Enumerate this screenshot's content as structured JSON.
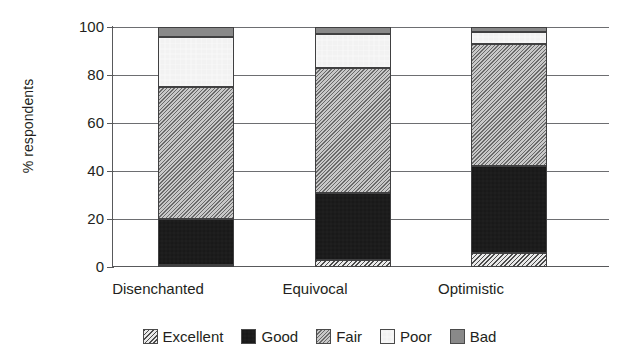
{
  "chart_data": {
    "type": "bar",
    "subtype": "stacked-bar-100",
    "title": "",
    "xlabel": "",
    "ylabel": "% respondents",
    "ylim": [
      0,
      100
    ],
    "yticks": [
      0,
      20,
      40,
      60,
      80,
      100
    ],
    "ytick_labels": [
      "0",
      "20",
      "40",
      "60",
      "80",
      "100"
    ],
    "grid": "horizontal",
    "legend_position": "bottom",
    "categories": [
      "Disenchanted",
      "Equivocal",
      "Optimistic"
    ],
    "series": [
      {
        "name": "Excellent",
        "values": [
          1,
          3,
          6
        ],
        "pattern": "diagonal-hatch",
        "color": "#b9b9b9"
      },
      {
        "name": "Good",
        "values": [
          19,
          28,
          36
        ],
        "pattern": "checkerboard-dark",
        "color": "#333333"
      },
      {
        "name": "Fair",
        "values": [
          55,
          52,
          51
        ],
        "pattern": "fine-diagonal",
        "color": "#9c9c9c"
      },
      {
        "name": "Poor",
        "values": [
          21,
          14,
          5
        ],
        "pattern": "dotted-light",
        "color": "#f2f2f2"
      },
      {
        "name": "Bad",
        "values": [
          4,
          3,
          2
        ],
        "pattern": "solid",
        "color": "#898989"
      }
    ],
    "cumulative_tops": {
      "Disenchanted": [
        1,
        20,
        75,
        96,
        100
      ],
      "Equivocal": [
        3,
        31,
        83,
        97,
        100
      ],
      "Optimistic": [
        6,
        42,
        93,
        98,
        100
      ]
    }
  },
  "axis": {
    "y_label": "% respondents",
    "ticks": [
      {
        "label": "100",
        "value": 100
      },
      {
        "label": "80",
        "value": 80
      },
      {
        "label": "60",
        "value": 60
      },
      {
        "label": "40",
        "value": 40
      },
      {
        "label": "20",
        "value": 20
      },
      {
        "label": "0",
        "value": 0
      }
    ]
  },
  "categories": [
    {
      "label": "Disenchanted"
    },
    {
      "label": "Equivocal"
    },
    {
      "label": "Optimistic"
    }
  ],
  "legend": {
    "items": [
      {
        "label": "Excellent",
        "swatch": "excellent-swatch-icon"
      },
      {
        "label": "Good",
        "swatch": "good-swatch-icon"
      },
      {
        "label": "Fair",
        "swatch": "fair-swatch-icon"
      },
      {
        "label": "Poor",
        "swatch": "poor-swatch-icon"
      },
      {
        "label": "Bad",
        "swatch": "bad-swatch-icon"
      }
    ]
  }
}
